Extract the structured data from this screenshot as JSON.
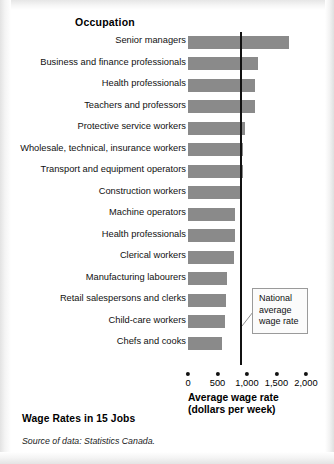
{
  "figure": {
    "title": "Wage Rates in 15 Jobs",
    "source": "Source of data: Statistics Canada.",
    "column_header": "Occupation",
    "callout": "National average wage rate"
  },
  "chart_data": {
    "type": "bar",
    "orientation": "horizontal",
    "title": "Wage Rates in 15 Jobs",
    "xlabel": "Average wage rate (dollars per week)",
    "ylabel": "Occupation",
    "xlim": [
      0,
      2000
    ],
    "xticks": [
      0,
      500,
      1000,
      1500,
      2000
    ],
    "xticklabels": [
      "0",
      "500",
      "1,000",
      "1,500",
      "2,000"
    ],
    "grid": false,
    "legend": false,
    "bar_color": "#8a8a8a",
    "categories": [
      "Senior managers",
      "Business and finance professionals",
      "Health professionals",
      "Teachers and professors",
      "Protective service workers",
      "Wholesale, technical, insurance workers",
      "Transport and equipment operators",
      "Construction workers",
      "Machine operators",
      "Health professionals",
      "Clerical workers",
      "Manufacturing labourers",
      "Retail salespersons and clerks",
      "Child-care workers",
      "Chefs and cooks"
    ],
    "values": [
      1720,
      1180,
      1140,
      1140,
      960,
      940,
      930,
      900,
      800,
      790,
      780,
      660,
      640,
      620,
      570
    ],
    "annotations": [
      {
        "type": "vline",
        "label": "National average wage rate",
        "value": 900
      }
    ]
  }
}
